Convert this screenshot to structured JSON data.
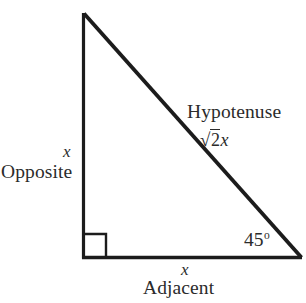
{
  "diagram": {
    "type": "right-triangle-45-45-90",
    "vertices": {
      "apex": [
        83,
        13
      ],
      "right_angle": [
        83,
        258
      ],
      "acute": [
        301,
        258
      ]
    },
    "stroke_color": "#1c1c1c",
    "background_color": "#ffffff",
    "right_angle_marker": {
      "size": 22,
      "present": true
    },
    "labels": {
      "hypotenuse_name": "Hypotenuse",
      "hypotenuse_value_radical": "√",
      "hypotenuse_value_radicand": "2",
      "hypotenuse_value_variable": "x",
      "opposite_variable": "x",
      "opposite_name": "Opposite",
      "adjacent_variable": "x",
      "adjacent_name": "Adjacent",
      "angle_value": "45",
      "angle_degree_symbol": "o"
    }
  }
}
